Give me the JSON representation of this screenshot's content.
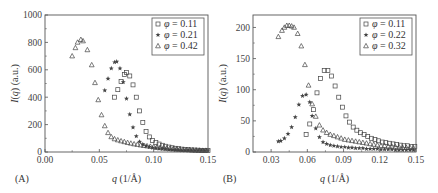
{
  "chart_data": [
    {
      "panel": "(A)",
      "type": "scatter",
      "title": "",
      "xlabel": "q (1/Å)",
      "ylabel": "I(q) (a.u.)",
      "xlim": [
        0.0,
        0.15
      ],
      "ylim": [
        0,
        1000
      ],
      "xticks": [
        "0.00",
        "0.05",
        "0.10",
        "0.15"
      ],
      "yticks": [
        "0",
        "200",
        "400",
        "600",
        "800",
        "1000"
      ],
      "grid": false,
      "legend_position": "upper right",
      "series": [
        {
          "name": "φ = 0.11",
          "marker": "square",
          "x": [
            0.064,
            0.067,
            0.07,
            0.073,
            0.075,
            0.078,
            0.081,
            0.084,
            0.087,
            0.09,
            0.093,
            0.096,
            0.099,
            0.102,
            0.105,
            0.108,
            0.111,
            0.114,
            0.117,
            0.12,
            0.123,
            0.126,
            0.129,
            0.132,
            0.135,
            0.138,
            0.141,
            0.144,
            0.147,
            0.15
          ],
          "y": [
            400,
            455,
            515,
            565,
            580,
            555,
            490,
            400,
            300,
            215,
            150,
            110,
            85,
            70,
            58,
            49,
            42,
            36,
            31,
            27,
            24,
            21,
            19,
            17,
            15,
            14,
            13,
            12,
            11,
            10
          ]
        },
        {
          "name": "φ = 0.21",
          "marker": "star",
          "x": [
            0.055,
            0.058,
            0.061,
            0.064,
            0.066,
            0.069,
            0.072,
            0.075,
            0.078,
            0.081,
            0.084,
            0.087,
            0.09,
            0.093,
            0.096,
            0.099,
            0.102,
            0.105,
            0.108,
            0.111,
            0.114,
            0.117,
            0.12,
            0.123,
            0.126,
            0.129,
            0.132,
            0.135,
            0.138,
            0.141,
            0.144,
            0.147,
            0.15
          ],
          "y": [
            450,
            535,
            610,
            655,
            660,
            610,
            510,
            390,
            275,
            180,
            115,
            75,
            55,
            44,
            37,
            32,
            28,
            25,
            22,
            20,
            18,
            16,
            14,
            13,
            12,
            11,
            10,
            9,
            8,
            8,
            7,
            7,
            6
          ]
        },
        {
          "name": "φ = 0.42",
          "marker": "triangle",
          "x": [
            0.025,
            0.028,
            0.03,
            0.033,
            0.035,
            0.039,
            0.043,
            0.046,
            0.049,
            0.052,
            0.055,
            0.058,
            0.061,
            0.064,
            0.067,
            0.07,
            0.073,
            0.076,
            0.079,
            0.082,
            0.085,
            0.088,
            0.091,
            0.094,
            0.097,
            0.1,
            0.103,
            0.106,
            0.109,
            0.112,
            0.115,
            0.118,
            0.121,
            0.124,
            0.127,
            0.13,
            0.133,
            0.136,
            0.139,
            0.142,
            0.145,
            0.148
          ],
          "y": [
            700,
            760,
            800,
            820,
            810,
            745,
            635,
            505,
            380,
            270,
            190,
            140,
            110,
            95,
            87,
            80,
            74,
            68,
            63,
            58,
            54,
            50,
            46,
            43,
            40,
            37,
            34,
            31,
            29,
            27,
            25,
            23,
            21,
            19,
            17,
            16,
            15,
            14,
            13,
            12,
            11,
            10
          ]
        }
      ]
    },
    {
      "panel": "(B)",
      "type": "scatter",
      "title": "",
      "xlabel": "q (1/Å)",
      "ylabel": "I(q) (a.u.)",
      "xlim": [
        0.015,
        0.15
      ],
      "ylim": [
        0,
        220
      ],
      "xticks": [
        "0.03",
        "0.06",
        "0.09",
        "0.12",
        "0.15"
      ],
      "yticks": [
        "0",
        "50",
        "100",
        "150",
        "200"
      ],
      "grid": false,
      "legend_position": "upper right",
      "series": [
        {
          "name": "φ = 0.11",
          "marker": "square",
          "x": [
            0.059,
            0.062,
            0.065,
            0.068,
            0.071,
            0.074,
            0.077,
            0.08,
            0.083,
            0.086,
            0.089,
            0.092,
            0.095,
            0.098,
            0.101,
            0.104,
            0.107,
            0.11,
            0.113,
            0.116,
            0.119,
            0.122,
            0.125,
            0.128,
            0.131,
            0.134,
            0.137,
            0.14,
            0.143,
            0.146,
            0.149
          ],
          "y": [
            28,
            45,
            68,
            95,
            118,
            131,
            131,
            122,
            106,
            88,
            72,
            58,
            48,
            40,
            35,
            31,
            28,
            25,
            22,
            20,
            18,
            16,
            15,
            14,
            13,
            12,
            11,
            10,
            10,
            9,
            9
          ]
        },
        {
          "name": "φ = 0.22",
          "marker": "star",
          "x": [
            0.036,
            0.038,
            0.041,
            0.044,
            0.047,
            0.05,
            0.053,
            0.056,
            0.059,
            0.062,
            0.064,
            0.067,
            0.07,
            0.073,
            0.076,
            0.079,
            0.082,
            0.085,
            0.088,
            0.091,
            0.094,
            0.097,
            0.1,
            0.103,
            0.106,
            0.109,
            0.112,
            0.115,
            0.118,
            0.121,
            0.124,
            0.127,
            0.13,
            0.133,
            0.136,
            0.139,
            0.142,
            0.145,
            0.148
          ],
          "y": [
            17,
            18,
            22,
            29,
            40,
            56,
            76,
            90,
            92,
            80,
            58,
            38,
            24,
            16,
            13,
            11,
            10,
            9,
            8,
            8,
            7,
            7,
            6,
            6,
            6,
            5,
            5,
            5,
            5,
            4,
            4,
            4,
            4,
            3,
            3,
            3,
            3,
            3,
            3
          ]
        },
        {
          "name": "φ = 0.32",
          "marker": "triangle",
          "x": [
            0.036,
            0.039,
            0.041,
            0.043,
            0.045,
            0.047,
            0.049,
            0.052,
            0.055,
            0.058,
            0.061,
            0.064,
            0.067,
            0.07,
            0.073,
            0.076,
            0.079,
            0.082,
            0.085,
            0.088,
            0.091,
            0.094,
            0.097,
            0.1,
            0.103,
            0.106,
            0.109,
            0.112,
            0.115,
            0.118,
            0.121,
            0.124,
            0.127,
            0.13,
            0.133,
            0.136,
            0.139,
            0.142,
            0.145,
            0.148
          ],
          "y": [
            185,
            195,
            200,
            203,
            203,
            202,
            200,
            190,
            170,
            140,
            107,
            77,
            57,
            43,
            35,
            31,
            28,
            26,
            24,
            22,
            20,
            19,
            18,
            17,
            16,
            15,
            14,
            13,
            12,
            11,
            10,
            10,
            9,
            9,
            8,
            8,
            7,
            7,
            7,
            6
          ]
        }
      ]
    }
  ],
  "panels": [
    {
      "id": "A",
      "label": "(A)",
      "xlabel": "q (1/Å)",
      "ylabel": "I(q) (a.u.)",
      "legend": [
        "φ = 0.11",
        "φ = 0.21",
        "φ = 0.42"
      ]
    },
    {
      "id": "B",
      "label": "(B)",
      "xlabel": "q (1/Å)",
      "ylabel": "I(q) (a.u.)",
      "legend": [
        "φ = 0.11",
        "φ = 0.22",
        "φ = 0.32"
      ]
    }
  ],
  "colors": {
    "axis": "#555555",
    "marker": "#444444",
    "text": "#333333"
  }
}
